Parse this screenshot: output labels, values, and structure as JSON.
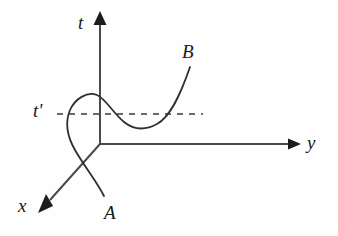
{
  "figure": {
    "kind": "spacetime-worldline-diagram",
    "background_color": "#fefefe",
    "ink_color": "#222222",
    "width": 338,
    "height": 236
  },
  "axes": {
    "origin": {
      "x": 100,
      "y": 144
    },
    "time": {
      "name": "t",
      "label": "t",
      "direction": "up",
      "from": {
        "x": 100,
        "y": 145
      },
      "to": {
        "x": 100,
        "y": 18
      },
      "arrow_tip": {
        "x": 100,
        "y": 12
      },
      "label_position": {
        "x": 78,
        "y": 13
      }
    },
    "space_y": {
      "name": "y",
      "label": "y",
      "direction": "right",
      "from": {
        "x": 100,
        "y": 144
      },
      "to": {
        "x": 292,
        "y": 144
      },
      "arrow_tip": {
        "x": 301,
        "y": 144
      },
      "label_position": {
        "x": 307,
        "y": 133
      }
    },
    "space_x": {
      "name": "x",
      "label": "x",
      "direction": "down-left",
      "from": {
        "x": 100,
        "y": 144
      },
      "to": {
        "x": 46,
        "y": 204
      },
      "arrow_tip": {
        "x": 38,
        "y": 213
      },
      "label_position": {
        "x": 18,
        "y": 196
      }
    }
  },
  "constant_time_slice": {
    "name": "t-prime",
    "label": "t'",
    "style": "dashed",
    "y": 114,
    "x_start": 57,
    "x_end": 203,
    "dash_pattern": "5,5",
    "label_position": {
      "x": 33,
      "y": 101
    }
  },
  "worldline": {
    "name": "worldline-A-to-B",
    "style": "solid",
    "start_label": "A",
    "end_label": "B",
    "start_point": {
      "x": 104,
      "y": 196
    },
    "end_point": {
      "x": 190,
      "y": 67
    },
    "peak": {
      "x": 100,
      "y": 96
    },
    "trough": {
      "x": 150,
      "y": 128
    },
    "left_bulge_x": 66,
    "self_intersection": {
      "x": 80,
      "y": 163
    },
    "description": "Curve rises from A, loops left past the t-axis to a local maximum on the t axis, dips to a minimum below the t-prime slice, then rises steeply to B"
  },
  "endpoints": {
    "a": {
      "label": "A",
      "label_position": {
        "x": 104,
        "y": 203
      }
    },
    "b": {
      "label": "B",
      "label_position": {
        "x": 182,
        "y": 42
      }
    }
  }
}
